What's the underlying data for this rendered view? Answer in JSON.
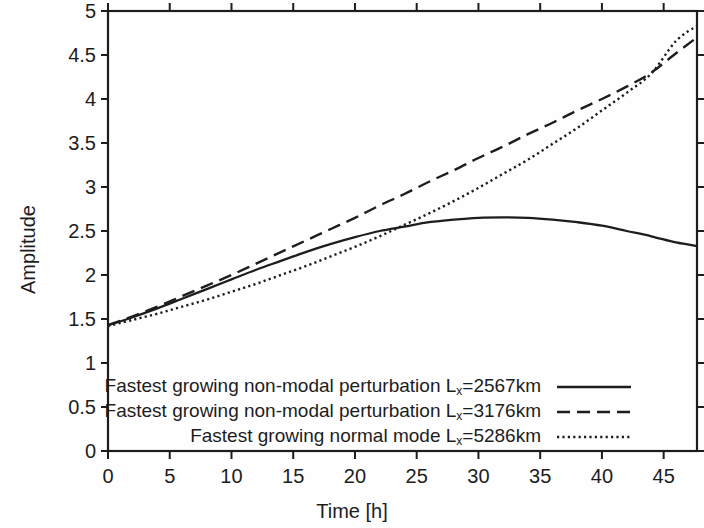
{
  "chart_data": {
    "type": "line",
    "title": "",
    "xlabel": "Time [h]",
    "ylabel": "Amplitude",
    "xlim": [
      0,
      47.7
    ],
    "ylim": [
      0,
      5
    ],
    "grid": false,
    "legend_position": "inside-bottom-left",
    "xticks": [
      0,
      5,
      10,
      15,
      20,
      25,
      30,
      35,
      40,
      45
    ],
    "xtick_labels": [
      "0",
      "5",
      "10",
      "15",
      "20",
      "25",
      "30",
      "35",
      "40",
      "45"
    ],
    "yticks": [
      0,
      0.5,
      1,
      1.5,
      2,
      2.5,
      3,
      3.5,
      4,
      4.5,
      5
    ],
    "ytick_labels": [
      "0",
      "0.5",
      "1",
      "1.5",
      "2",
      "2.5",
      "3",
      "3.5",
      "4",
      "4.5",
      "5"
    ],
    "series": [
      {
        "name": "Fastest growing non-modal perturbation Lx=2567km",
        "label_prefix": "Fastest growing non-modal perturbation L",
        "label_sub": "x",
        "label_suffix": "=2567km",
        "style": "solid",
        "color": "#1d1d1d",
        "x": [
          0,
          2,
          4,
          6,
          8,
          10,
          12,
          14,
          16,
          18,
          20,
          22,
          24,
          26,
          28,
          30,
          32,
          34,
          36,
          38,
          40,
          42,
          44,
          46,
          47.7
        ],
        "y": [
          1.43,
          1.52,
          1.62,
          1.73,
          1.84,
          1.95,
          2.06,
          2.16,
          2.26,
          2.35,
          2.43,
          2.5,
          2.55,
          2.6,
          2.63,
          2.65,
          2.655,
          2.65,
          2.63,
          2.6,
          2.56,
          2.5,
          2.44,
          2.37,
          2.33
        ]
      },
      {
        "name": "Fastest growing non-modal perturbation Lx=3176km",
        "label_prefix": "Fastest growing non-modal perturbation L",
        "label_sub": "x",
        "label_suffix": "=3176km",
        "style": "dashed",
        "color": "#1d1d1d",
        "x": [
          0,
          2,
          4,
          6,
          8,
          10,
          12,
          14,
          16,
          18,
          20,
          22,
          24,
          26,
          28,
          30,
          32,
          34,
          36,
          38,
          40,
          42,
          44,
          46,
          47.7
        ],
        "y": [
          1.43,
          1.53,
          1.64,
          1.76,
          1.88,
          2.0,
          2.13,
          2.26,
          2.39,
          2.52,
          2.65,
          2.79,
          2.92,
          3.06,
          3.19,
          3.33,
          3.46,
          3.6,
          3.73,
          3.87,
          4.0,
          4.14,
          4.3,
          4.52,
          4.7
        ]
      },
      {
        "name": "Fastest growing normal mode Lx=5286km",
        "label_prefix": "Fastest growing normal mode L",
        "label_sub": "x",
        "label_suffix": "=5286km",
        "style": "dotted",
        "color": "#1d1d1d",
        "x": [
          0,
          2,
          4,
          6,
          8,
          10,
          12,
          14,
          16,
          18,
          20,
          22,
          24,
          26,
          28,
          30,
          32,
          34,
          36,
          38,
          40,
          42,
          44,
          46,
          47.7
        ],
        "y": [
          1.42,
          1.49,
          1.56,
          1.64,
          1.72,
          1.81,
          1.9,
          2.0,
          2.1,
          2.21,
          2.32,
          2.44,
          2.57,
          2.7,
          2.84,
          2.99,
          3.15,
          3.31,
          3.49,
          3.67,
          3.87,
          4.07,
          4.29,
          4.66,
          4.83
        ]
      }
    ]
  },
  "legend": {
    "entries": [
      {
        "text": "Fastest growing non-modal perturbation Lx=2567km",
        "prefix": "Fastest growing non-modal perturbation L",
        "sub": "x",
        "suffix": "=2567km",
        "style": "solid"
      },
      {
        "text": "Fastest growing non-modal perturbation Lx=3176km",
        "prefix": "Fastest growing non-modal perturbation L",
        "sub": "x",
        "suffix": "=3176km",
        "style": "dashed"
      },
      {
        "text": "Fastest growing normal mode Lx=5286km",
        "prefix": "Fastest growing normal mode L",
        "sub": "x",
        "suffix": "=5286km",
        "style": "dotted"
      }
    ]
  },
  "colors": {
    "axis": "#1d1d1d",
    "line": "#1d1d1d",
    "background": "#fefefe"
  }
}
